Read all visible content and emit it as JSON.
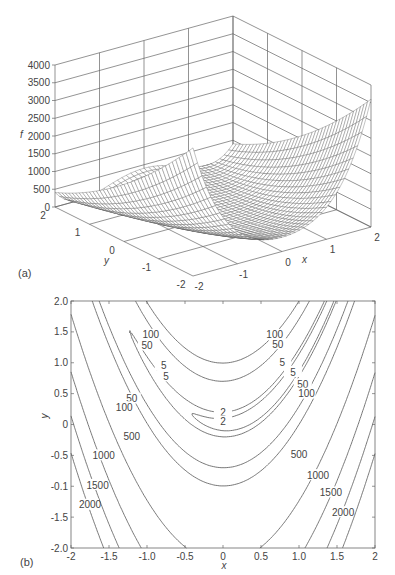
{
  "chart_data": [
    {
      "panel_label": "(a)",
      "type": "surface3d",
      "function": "f(x,y) = 100(y - x^2)^2 + (1 - x)^2",
      "xlabel": "x",
      "ylabel": "y",
      "zlabel": "f",
      "xlim": [
        -2,
        2
      ],
      "ylim": [
        -2,
        2
      ],
      "zlim": [
        0,
        4000
      ],
      "x_ticks": [
        "-2",
        "-1",
        "0",
        "1",
        "2"
      ],
      "y_ticks": [
        "-2",
        "-1",
        "0",
        "1",
        "2"
      ],
      "z_ticks": [
        "0",
        "500",
        "1000",
        "1500",
        "2000",
        "2500",
        "3000",
        "3500",
        "4000"
      ],
      "grid": true,
      "mesh_color": "#555555"
    },
    {
      "panel_label": "(b)",
      "type": "contour",
      "function": "f(x,y) = 100(y - x^2)^2 + (1 - x)^2",
      "xlabel": "x",
      "ylabel": "y",
      "xlim": [
        -2,
        2
      ],
      "ylim": [
        -2,
        2
      ],
      "x_ticks": [
        "-2",
        "-1.5",
        "-1.0",
        "-0.5",
        "0",
        "0.5",
        "1.0",
        "1.5",
        "2"
      ],
      "y_ticks": [
        "2.0",
        "1.5",
        "1.0",
        "0.5",
        "0",
        "-0.5",
        "-0.1",
        "-1.5",
        "-2.0"
      ],
      "contour_levels": [
        2,
        5,
        50,
        100,
        500,
        1000,
        1500,
        2000
      ],
      "contour_labels": [
        {
          "text": "100",
          "x": -0.95,
          "y": 1.45
        },
        {
          "text": "50",
          "x": -1.0,
          "y": 1.28
        },
        {
          "text": "5",
          "x": -0.78,
          "y": 0.95
        },
        {
          "text": "5",
          "x": -0.75,
          "y": 0.78
        },
        {
          "text": "50",
          "x": -1.2,
          "y": 0.42
        },
        {
          "text": "100",
          "x": -1.3,
          "y": 0.28
        },
        {
          "text": "100",
          "x": 0.68,
          "y": 1.45
        },
        {
          "text": "50",
          "x": 0.72,
          "y": 1.3
        },
        {
          "text": "5",
          "x": 0.78,
          "y": 1.0
        },
        {
          "text": "5",
          "x": 0.92,
          "y": 0.85
        },
        {
          "text": "50",
          "x": 1.05,
          "y": 0.65
        },
        {
          "text": "100",
          "x": 1.1,
          "y": 0.5
        },
        {
          "text": "2",
          "x": 0.0,
          "y": 0.2
        },
        {
          "text": "2",
          "x": 0.0,
          "y": 0.05
        },
        {
          "text": "500",
          "x": -1.2,
          "y": -0.2
        },
        {
          "text": "1000",
          "x": -1.57,
          "y": -0.5
        },
        {
          "text": "1500",
          "x": -1.65,
          "y": -0.98
        },
        {
          "text": "2000",
          "x": -1.75,
          "y": -1.3
        },
        {
          "text": "500",
          "x": 1.0,
          "y": -0.48
        },
        {
          "text": "1000",
          "x": 1.25,
          "y": -0.82
        },
        {
          "text": "1500",
          "x": 1.42,
          "y": -1.1
        },
        {
          "text": "2000",
          "x": 1.58,
          "y": -1.42
        }
      ],
      "line_color": "#555555"
    }
  ],
  "figure": {
    "panel_a_label": "(a)",
    "panel_b_label": "(b)"
  }
}
